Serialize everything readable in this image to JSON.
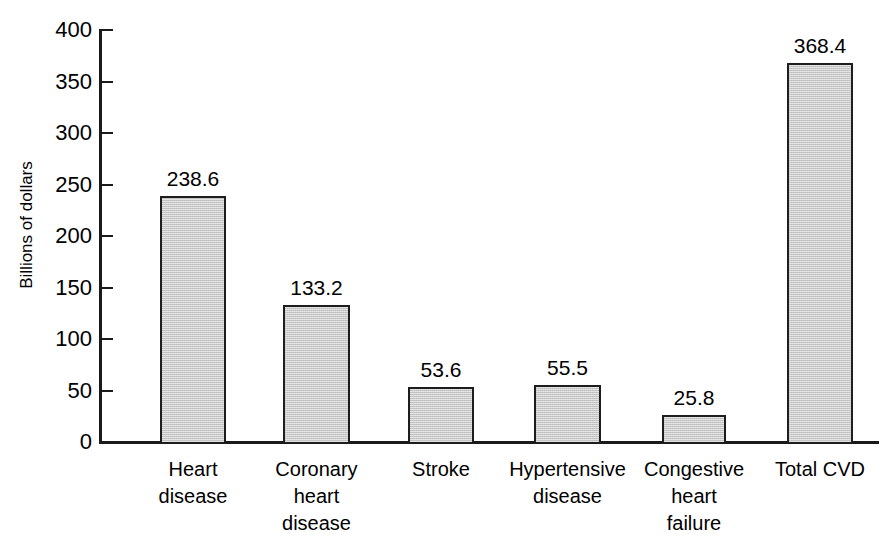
{
  "chart_data": {
    "type": "bar",
    "title": "",
    "subtitle": "",
    "xlabel": "",
    "ylabel": "Billions of dollars",
    "ylim": [
      0,
      400
    ],
    "ytick_values": [
      0,
      50,
      100,
      150,
      200,
      250,
      300,
      350,
      400
    ],
    "ytick_labels": [
      "0",
      "50",
      "100",
      "150",
      "200",
      "250",
      "300",
      "350",
      "400"
    ],
    "grid": false,
    "legend": false,
    "legend_position": "none",
    "categories": [
      "Heart\ndisease",
      "Coronary\nheart\ndisease",
      "Stroke",
      "Hypertensive\ndisease",
      "Congestive\nheart\nfailure",
      "Total CVD"
    ],
    "values": [
      238.6,
      133.2,
      53.6,
      55.5,
      25.8,
      368.4
    ],
    "value_labels": [
      "238.6",
      "133.2",
      "53.6",
      "55.5",
      "25.8",
      "368.4"
    ],
    "bar_fill_color": "#c7c7c7",
    "bar_edge_color": "#1d1d1d",
    "axis_color": "#1a1a1a",
    "background_color": "#ffffff"
  }
}
